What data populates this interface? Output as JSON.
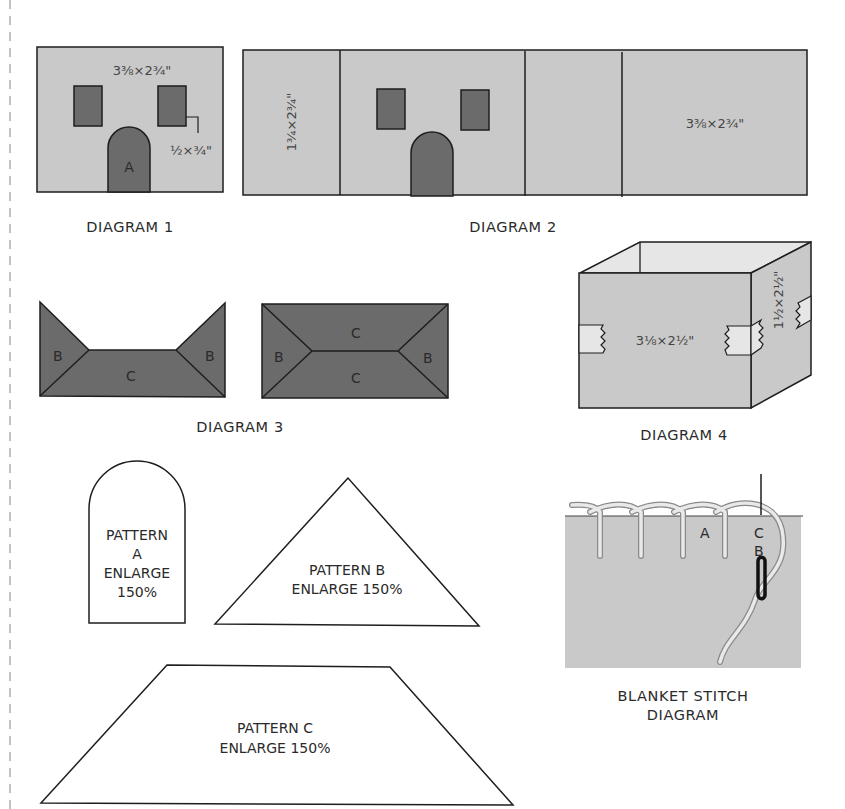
{
  "colors": {
    "light_fill": "#c9c9c9",
    "dark_fill": "#6b6b6b",
    "pale_fill": "#e6e6e6",
    "stroke": "#1e1e1e",
    "cut_line": "#999999"
  },
  "diagram1": {
    "caption": "DIAGRAM 1",
    "panel_dim": "3⅜×2¾\"",
    "window_dim": "½×¾\"",
    "door_label": "A"
  },
  "diagram2": {
    "caption": "DIAGRAM 2",
    "side_dim": "1¾×2¾\"",
    "back_dim": "3⅜×2¾\""
  },
  "diagram3": {
    "caption": "DIAGRAM 3",
    "left_shape": {
      "labels": [
        "B",
        "C",
        "B"
      ]
    },
    "right_shape": {
      "labels": [
        "C",
        "B",
        "C",
        "B"
      ]
    }
  },
  "diagram4": {
    "caption": "DIAGRAM 4",
    "front_dim": "3⅛×2½\"",
    "side_dim": "1½×2½\""
  },
  "pattern_a": {
    "line1": "PATTERN",
    "line2": "A",
    "line3": "ENLARGE",
    "line4": "150%"
  },
  "pattern_b": {
    "line1": "PATTERN B",
    "line2": "ENLARGE 150%"
  },
  "pattern_c": {
    "line1": "PATTERN C",
    "line2": "ENLARGE 150%"
  },
  "blanket_stitch": {
    "caption_line1": "BLANKET STITCH",
    "caption_line2": "DIAGRAM",
    "point_a": "A",
    "point_b": "B",
    "point_c": "C"
  }
}
